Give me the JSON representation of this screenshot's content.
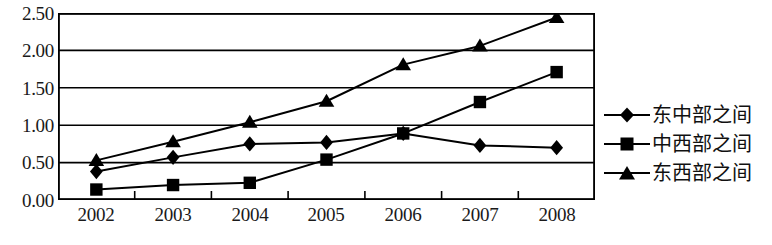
{
  "chart_data": {
    "type": "line",
    "title": "",
    "subtitle": "",
    "xlabel": "",
    "ylabel": "",
    "categories": [
      "2002",
      "2003",
      "2004",
      "2005",
      "2006",
      "2007",
      "2008"
    ],
    "x": [
      "2002",
      "2003",
      "2004",
      "2005",
      "2006",
      "2007",
      "2008"
    ],
    "series": [
      {
        "name": "东中部之间",
        "marker": "diamond",
        "values": [
          0.38,
          0.57,
          0.75,
          0.77,
          0.89,
          0.73,
          0.7
        ]
      },
      {
        "name": "中西部之间",
        "marker": "square",
        "values": [
          0.14,
          0.2,
          0.23,
          0.54,
          0.89,
          1.31,
          1.71
        ]
      },
      {
        "name": "东西部之间",
        "marker": "triangle",
        "values": [
          0.53,
          0.78,
          1.04,
          1.32,
          1.81,
          2.06,
          2.44
        ]
      }
    ],
    "ylim": [
      0.0,
      2.5
    ],
    "ytick_step": 0.5,
    "ytick_labels": [
      "2.50",
      "2.00",
      "1.50",
      "1.00",
      "0.50",
      "0.00"
    ],
    "ytick_values": [
      2.5,
      2.0,
      1.5,
      1.0,
      0.5,
      0.0
    ],
    "grid": true,
    "grid_axis": "y",
    "legend_position": "right",
    "line_color": "#000000",
    "grid_color": "#000000",
    "background_color": "#ffffff"
  },
  "legend": {
    "items": [
      {
        "label": "东中部之间",
        "marker": "diamond"
      },
      {
        "label": "中西部之间",
        "marker": "square"
      },
      {
        "label": "东西部之间",
        "marker": "triangle"
      }
    ]
  },
  "axes": {
    "y_labels": [
      "2.50",
      "2.00",
      "1.50",
      "1.00",
      "0.50",
      "0.00"
    ],
    "x_labels": [
      "2002",
      "2003",
      "2004",
      "2005",
      "2006",
      "2007",
      "2008"
    ]
  }
}
